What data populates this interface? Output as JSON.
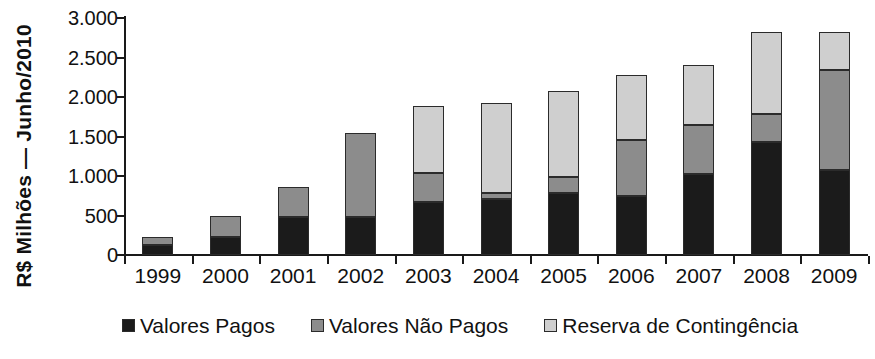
{
  "chart_data": {
    "type": "bar",
    "stacked": true,
    "title": "",
    "xlabel": "",
    "ylabel": "R$ Milhões — Junho/2010",
    "ylim": [
      0,
      3000
    ],
    "ytick_labels": [
      "0",
      "500",
      "1.000",
      "1.500",
      "2.000",
      "2.500",
      "3.000"
    ],
    "ytick_values": [
      0,
      500,
      1000,
      1500,
      2000,
      2500,
      3000
    ],
    "grid": false,
    "legend_position": "bottom",
    "categories": [
      "1999",
      "2000",
      "2001",
      "2002",
      "2003",
      "2004",
      "2005",
      "2006",
      "2007",
      "2008",
      "2009"
    ],
    "series": [
      {
        "name": "Valores Pagos",
        "color": "#1b1b1b",
        "values": [
          130,
          230,
          480,
          480,
          670,
          710,
          780,
          750,
          1030,
          1430,
          1070
        ]
      },
      {
        "name": "Valores Não Pagos",
        "color": "#8c8c8c",
        "values": [
          100,
          260,
          380,
          1060,
          370,
          80,
          210,
          700,
          610,
          360,
          1270
        ]
      },
      {
        "name": "Reserva de Contingência",
        "color": "#cfcfcf",
        "values": [
          0,
          0,
          0,
          0,
          840,
          1130,
          1080,
          830,
          760,
          1030,
          480
        ]
      }
    ],
    "totals": [
      230,
      490,
      860,
      1540,
      1880,
      1920,
      2070,
      2280,
      2400,
      2820,
      2820
    ]
  },
  "legend": {
    "items": [
      {
        "label": "Valores Pagos",
        "swatch": "#1b1b1b"
      },
      {
        "label": "Valores Não Pagos",
        "swatch": "#8c8c8c"
      },
      {
        "label": "Reserva de Contingência",
        "swatch": "#cfcfcf"
      }
    ]
  },
  "axis": {
    "y_title": "R$ Milhões — Junho/2010"
  }
}
